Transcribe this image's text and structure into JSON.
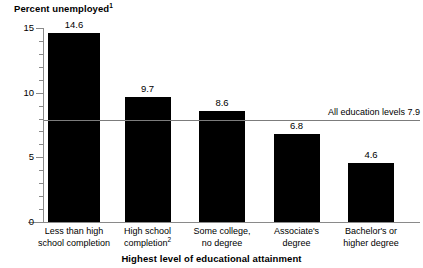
{
  "chart_data": {
    "type": "bar",
    "title": "",
    "ylabel": "Percent unemployed",
    "ylabel_footnote": "1",
    "xlabel": "Highest level of educational attainment",
    "categories": [
      "Less than high school completion",
      "High school completion",
      "Some college, no degree",
      "Associate's degree",
      "Bachelor's or higher degree"
    ],
    "category_lines": [
      [
        "Less than high",
        "school completion"
      ],
      [
        "High school",
        "completion"
      ],
      [
        "Some college,",
        "no degree"
      ],
      [
        "Associate's",
        "degree"
      ],
      [
        "Bachelor's or",
        "higher degree"
      ]
    ],
    "category_footnotes": [
      "",
      "2",
      "",
      "",
      ""
    ],
    "values": [
      14.6,
      9.7,
      8.6,
      6.8,
      4.6
    ],
    "value_labels": [
      "14.6",
      "9.7",
      "8.6",
      "6.8",
      "4.6"
    ],
    "ylim": [
      0,
      15
    ],
    "ytick_labels": [
      "0",
      "5",
      "10",
      "15"
    ],
    "ytick_values": [
      0,
      5,
      10,
      15
    ],
    "yminor_values": [
      1,
      2,
      3,
      4,
      6,
      7,
      8,
      9,
      11,
      12,
      13,
      14
    ],
    "grid": false,
    "legend": false,
    "bar_color": "#000000",
    "axis_color": "#8a8a8a",
    "reference_line": {
      "label": "All education levels 7.9",
      "value": 7.9,
      "color": "#7c7c7c"
    }
  }
}
